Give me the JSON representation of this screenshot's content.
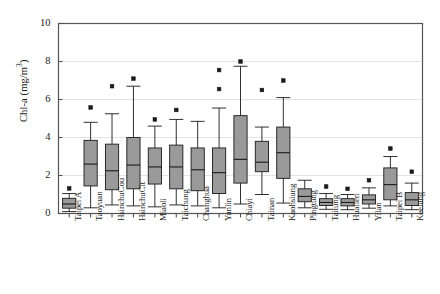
{
  "chart_data": {
    "type": "box",
    "title": "",
    "xlabel": "",
    "ylabel": "Chl-a (mg/m3)",
    "ylabel_text": "Chl-a (mg/m",
    "ylabel_sup": "3",
    "ylabel_tail": ")",
    "ylim": [
      0,
      10
    ],
    "yticks": [
      0,
      2,
      4,
      6,
      8,
      10
    ],
    "ytick_labels": [
      "0",
      "2",
      "4",
      "6",
      "8",
      "10"
    ],
    "grid": "horizontal-light",
    "legend": "none",
    "box_fill": "#9a9a9a",
    "line_color": "#1a1a1a",
    "frame_color": "#555555",
    "categories": [
      "Taipei A",
      "Taoyuan",
      "HsinchuCou",
      "HsinchuCit",
      "Miaoli",
      "Taichung",
      "Changhua",
      "Yunlin",
      "Chiayi",
      "Tainan",
      "Kaohsiung",
      "Pingtung",
      "Taitung",
      "Hualien",
      "Yilan",
      "Taipei B",
      "Keelung"
    ],
    "boxes": [
      {
        "label": "Taipei A",
        "whisker_low": 0.1,
        "q1": 0.28,
        "median": 0.5,
        "q3": 0.8,
        "whisker_high": 1.05,
        "outliers": [
          1.32
        ]
      },
      {
        "label": "Taoyuan",
        "whisker_low": 0.3,
        "q1": 1.45,
        "median": 2.6,
        "q3": 3.85,
        "whisker_high": 4.8,
        "outliers": [
          5.58
        ]
      },
      {
        "label": "HsinchuCou",
        "whisker_low": 0.45,
        "q1": 1.25,
        "median": 2.25,
        "q3": 3.65,
        "whisker_high": 5.25,
        "outliers": [
          6.7
        ]
      },
      {
        "label": "HsinchuCit",
        "whisker_low": 0.4,
        "q1": 1.3,
        "median": 2.55,
        "q3": 4.0,
        "whisker_high": 6.7,
        "outliers": [
          7.1
        ]
      },
      {
        "label": "Miaoli",
        "whisker_low": 0.35,
        "q1": 1.55,
        "median": 2.45,
        "q3": 3.45,
        "whisker_high": 4.6,
        "outliers": [
          4.95
        ]
      },
      {
        "label": "Taichung",
        "whisker_low": 0.45,
        "q1": 1.3,
        "median": 2.45,
        "q3": 3.6,
        "whisker_high": 4.95,
        "outliers": [
          5.45
        ]
      },
      {
        "label": "Changhua",
        "whisker_low": 0.4,
        "q1": 1.2,
        "median": 2.3,
        "q3": 3.45,
        "whisker_high": 4.85,
        "outliers": []
      },
      {
        "label": "Yunlin",
        "whisker_low": 0.3,
        "q1": 1.05,
        "median": 2.15,
        "q3": 3.45,
        "whisker_high": 5.55,
        "outliers": [
          6.55,
          7.55
        ]
      },
      {
        "label": "Chiayi",
        "whisker_low": 0.5,
        "q1": 1.6,
        "median": 2.85,
        "q3": 5.15,
        "whisker_high": 7.75,
        "outliers": [
          8.0
        ]
      },
      {
        "label": "Tainan",
        "whisker_low": 1.0,
        "q1": 2.2,
        "median": 2.7,
        "q3": 3.8,
        "whisker_high": 4.55,
        "outliers": [
          6.5
        ]
      },
      {
        "label": "Kaohsiung",
        "whisker_low": 0.55,
        "q1": 1.85,
        "median": 3.2,
        "q3": 4.55,
        "whisker_high": 6.1,
        "outliers": [
          7.0
        ]
      },
      {
        "label": "Pingtung",
        "whisker_low": 0.3,
        "q1": 0.62,
        "median": 0.9,
        "q3": 1.3,
        "whisker_high": 1.75,
        "outliers": []
      },
      {
        "label": "Taitung",
        "whisker_low": 0.22,
        "q1": 0.42,
        "median": 0.58,
        "q3": 0.78,
        "whisker_high": 1.05,
        "outliers": [
          1.42
        ]
      },
      {
        "label": "Hualien",
        "whisker_low": 0.2,
        "q1": 0.4,
        "median": 0.58,
        "q3": 0.78,
        "whisker_high": 1.0,
        "outliers": [
          1.3
        ]
      },
      {
        "label": "Yilan",
        "whisker_low": 0.28,
        "q1": 0.5,
        "median": 0.72,
        "q3": 0.98,
        "whisker_high": 1.35,
        "outliers": [
          1.75
        ]
      },
      {
        "label": "Taipei B",
        "whisker_low": 0.4,
        "q1": 0.72,
        "median": 1.52,
        "q3": 2.4,
        "whisker_high": 3.0,
        "outliers": [
          3.42
        ]
      },
      {
        "label": "Keelung",
        "whisker_low": 0.2,
        "q1": 0.42,
        "median": 0.72,
        "q3": 1.1,
        "whisker_high": 1.6,
        "outliers": [
          2.2
        ]
      }
    ]
  },
  "axes": {
    "y_axis_name": "y-axis",
    "x_axis_name": "x-axis"
  }
}
